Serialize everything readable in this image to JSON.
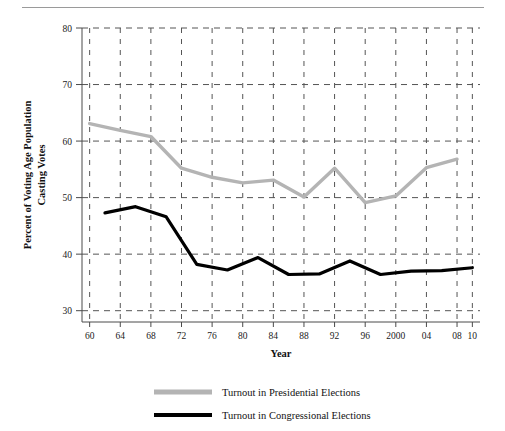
{
  "chart_data": {
    "type": "line",
    "title": "",
    "xlabel": "Year",
    "ylabel": "Percent of Voting Age Population Casting Votes",
    "ylabel_line1": "Percent of Voting Age Population",
    "ylabel_line2": "Casting Votes",
    "xlim": [
      1959,
      2011
    ],
    "ylim": [
      28,
      80
    ],
    "yticks": [
      30,
      40,
      50,
      60,
      70,
      80
    ],
    "ytick_labels": [
      "30",
      "40",
      "50",
      "60",
      "70",
      "80"
    ],
    "xticks": [
      1960,
      1964,
      1968,
      1972,
      1976,
      1980,
      1984,
      1988,
      1992,
      1996,
      2000,
      2004,
      2008,
      2010
    ],
    "xtick_labels": [
      "60",
      "64",
      "68",
      "72",
      "76",
      "80",
      "84",
      "88",
      "92",
      "96",
      "2000",
      "04",
      "08",
      "10"
    ],
    "grid": true,
    "grid_style": "dashed",
    "legend_position": "bottom",
    "series": [
      {
        "name": "Turnout in Presidential Elections",
        "color": "#b4b4b4",
        "x": [
          1960,
          1964,
          1968,
          1972,
          1976,
          1980,
          1984,
          1988,
          1992,
          1996,
          2000,
          2004,
          2008
        ],
        "values": [
          63.1,
          61.9,
          60.8,
          55.2,
          53.6,
          52.6,
          53.1,
          50.1,
          55.2,
          49.1,
          50.3,
          55.3,
          56.8
        ]
      },
      {
        "name": "Turnout in Congressional Elections",
        "color": "#000000",
        "x": [
          1962,
          1966,
          1970,
          1974,
          1978,
          1982,
          1986,
          1990,
          1994,
          1998,
          2002,
          2006,
          2010
        ],
        "values": [
          47.3,
          48.4,
          46.6,
          38.2,
          37.2,
          39.4,
          36.4,
          36.5,
          38.8,
          36.4,
          37.0,
          37.1,
          37.6
        ]
      }
    ]
  },
  "axis": {
    "x_title": "Year",
    "y_title_line1": "Percent of Voting Age Population",
    "y_title_line2": "Casting Votes"
  },
  "ticks": {
    "y": [
      "80",
      "70",
      "60",
      "50",
      "40",
      "30"
    ],
    "x": [
      "60",
      "64",
      "68",
      "72",
      "76",
      "80",
      "84",
      "88",
      "92",
      "96",
      "2000",
      "04",
      "08",
      "10"
    ]
  },
  "legend": {
    "items": [
      {
        "label": "Turnout in Presidential Elections",
        "color": "#b4b4b4"
      },
      {
        "label": "Turnout in Congressional Elections",
        "color": "#000000"
      }
    ]
  }
}
